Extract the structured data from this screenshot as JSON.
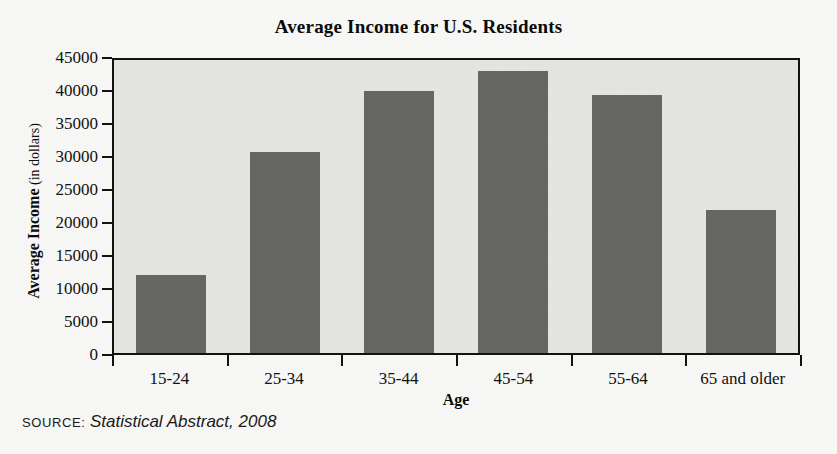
{
  "chart_data": {
    "type": "bar",
    "title": "Average Income for U.S. Residents",
    "categories": [
      "15-24",
      "25-34",
      "35-44",
      "45-54",
      "55-64",
      "65 and older"
    ],
    "values": [
      11800,
      30500,
      39700,
      42800,
      39100,
      21600
    ],
    "xlabel": "Age",
    "ylabel": "Average Income (in dollars)",
    "ylabel_bold_part": "Average Income",
    "ylabel_light_part": "(in dollars)",
    "ylim": [
      0,
      45000
    ],
    "ytick_values": [
      0,
      5000,
      10000,
      15000,
      20000,
      25000,
      30000,
      35000,
      40000,
      45000
    ],
    "ytick_labels": [
      "0",
      "5000",
      "10000",
      "15000",
      "20000",
      "25000",
      "30000",
      "35000",
      "40000",
      "45000"
    ],
    "grid": false,
    "legend": null,
    "bar_color": "#666663",
    "plot_background": "#e4e4e1",
    "axis_color": "#121212"
  },
  "source": {
    "label": "SOURCE:",
    "text": "Statistical Abstract, 2008"
  }
}
